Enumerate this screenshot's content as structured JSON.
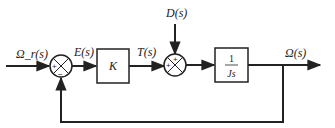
{
  "diagram": {
    "type": "block-diagram",
    "title": "",
    "signals": {
      "input": "Ω_r(s)",
      "error": "E(s)",
      "torque": "T(s)",
      "disturbance": "D(s)",
      "output": "Ω(s)"
    },
    "blocks": {
      "controller": "K",
      "plant_num": "1",
      "plant_den": "Js"
    },
    "summing_junctions": {
      "sj1": {
        "signs": [
          "+",
          "−"
        ]
      },
      "sj2": {
        "signs": [
          "+",
          "+"
        ]
      }
    },
    "colors": {
      "line": "#222222",
      "background": "#ffffff"
    }
  }
}
